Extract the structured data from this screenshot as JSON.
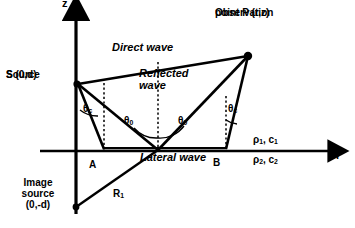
{
  "figure": {
    "title_text": ""
  },
  "axes": {
    "vertical_label": "z",
    "horizontal_label": "r"
  },
  "points": {
    "source": {
      "line1": "Source",
      "line2": "S (0,d)"
    },
    "image_source": {
      "line1": "Image",
      "line2": "source",
      "line3": "(0,-d)"
    },
    "observation": {
      "line1": "Observation",
      "line2": "point P (r,z)"
    },
    "a_label": "A",
    "b_label": "B"
  },
  "waves": {
    "direct": "Direct wave",
    "reflected_line1": "Reflected",
    "reflected_line2": "wave",
    "lateral": "Lateral wave"
  },
  "angles": {
    "critical_left": "θ",
    "critical_left_sub": "c",
    "incident": "θ",
    "incident_sub": "0",
    "reflected": "θ",
    "reflected_sub": "0",
    "critical_right": "θ",
    "critical_right_sub": "c"
  },
  "paths": {
    "r1_label": "R",
    "r1_sub": "1"
  },
  "media": {
    "upper": "ρ",
    "upper_sub1": "1",
    "upper_c": ", c",
    "upper_sub2": "1",
    "lower": "ρ",
    "lower_sub1": "2",
    "lower_c": ", c",
    "lower_sub2": "2"
  },
  "colors": {
    "ink": "#000000",
    "background": "#ffffff"
  }
}
